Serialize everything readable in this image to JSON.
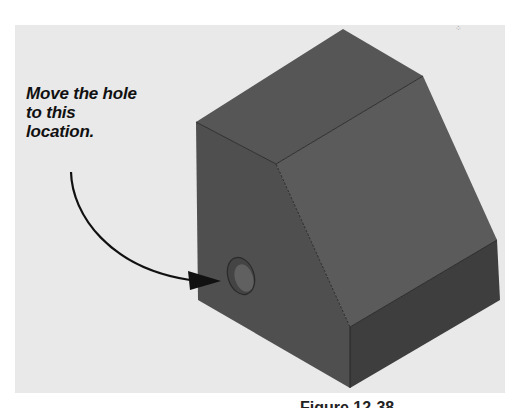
{
  "figure": {
    "callout": {
      "lines": [
        "Move the hole",
        "to this",
        "location."
      ]
    },
    "caption": "Figure 12-38",
    "colors": {
      "page_background": "#ffffff",
      "panel_background": "#e9e9e9",
      "top_face": "#555555",
      "front_face": "#4f4f4f",
      "slope_face": "#5a5a5a",
      "step_side_face": "#3e3e3e",
      "edge_line": "#222222",
      "arrow": "#111111",
      "text": "#111111"
    },
    "objects": [
      {
        "name": "block",
        "description": "Gray 3D solid block with a sloped face and a step, shown isometrically"
      },
      {
        "name": "hole",
        "description": "Circular hole on the front face near the lower-left"
      },
      {
        "name": "arrow",
        "description": "Curved arrow from the callout text pointing at the hole"
      }
    ]
  }
}
